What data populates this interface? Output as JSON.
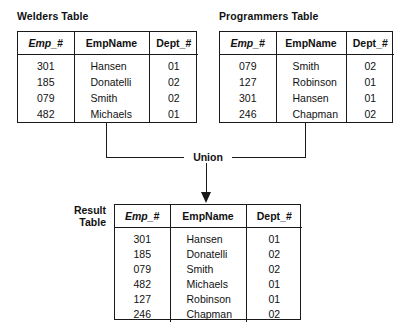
{
  "diagram": {
    "operation_label": "Union",
    "line_color": "#1a1a1a",
    "background": "#ffffff"
  },
  "columns": {
    "emp": "Emp_#",
    "name": "EmpName",
    "dept": "Dept_#"
  },
  "welders": {
    "title": "Welders Table",
    "headers": [
      "Emp_#",
      "EmpName",
      "Dept_#"
    ],
    "rows": [
      {
        "emp": "301",
        "name": "Hansen",
        "dept": "01"
      },
      {
        "emp": "185",
        "name": "Donatelli",
        "dept": "02"
      },
      {
        "emp": "079",
        "name": "Smith",
        "dept": "02"
      },
      {
        "emp": "482",
        "name": "Michaels",
        "dept": "01"
      }
    ]
  },
  "programmers": {
    "title": "Programmers Table",
    "headers": [
      "Emp_#",
      "EmpName",
      "Dept_#"
    ],
    "rows": [
      {
        "emp": "079",
        "name": "Smith",
        "dept": "02"
      },
      {
        "emp": "127",
        "name": "Robinson",
        "dept": "01"
      },
      {
        "emp": "301",
        "name": "Hansen",
        "dept": "01"
      },
      {
        "emp": "246",
        "name": "Chapman",
        "dept": "02"
      }
    ]
  },
  "result": {
    "title_line1": "Result",
    "title_line2": "Table",
    "headers": [
      "Emp_#",
      "EmpName",
      "Dept_#"
    ],
    "rows": [
      {
        "emp": "301",
        "name": "Hansen",
        "dept": "01"
      },
      {
        "emp": "185",
        "name": "Donatelli",
        "dept": "02"
      },
      {
        "emp": "079",
        "name": "Smith",
        "dept": "02"
      },
      {
        "emp": "482",
        "name": "Michaels",
        "dept": "01"
      },
      {
        "emp": "127",
        "name": "Robinson",
        "dept": "01"
      },
      {
        "emp": "246",
        "name": "Chapman",
        "dept": "02"
      }
    ]
  }
}
